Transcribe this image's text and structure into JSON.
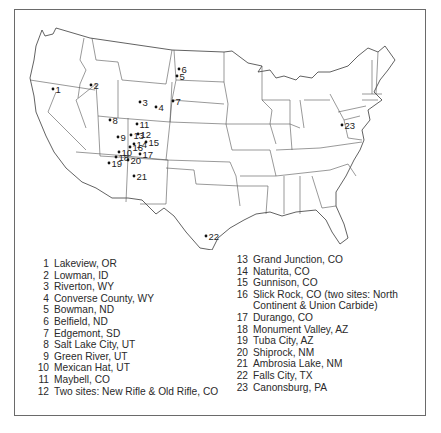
{
  "map": {
    "type": "US map of uranium mill tailings sites",
    "sites": [
      {
        "id": "1",
        "label": "1",
        "x": 53,
        "y": 89
      },
      {
        "id": "2",
        "label": "2",
        "x": 91,
        "y": 85
      },
      {
        "id": "3",
        "label": "3",
        "x": 140,
        "y": 102
      },
      {
        "id": "4",
        "label": "4",
        "x": 156,
        "y": 107
      },
      {
        "id": "5",
        "label": "5",
        "x": 177,
        "y": 76
      },
      {
        "id": "6",
        "label": "6",
        "x": 179,
        "y": 69
      },
      {
        "id": "7",
        "label": "7",
        "x": 173,
        "y": 101
      },
      {
        "id": "8",
        "label": "8",
        "x": 110,
        "y": 120
      },
      {
        "id": "9",
        "label": "9",
        "x": 118,
        "y": 137
      },
      {
        "id": "10",
        "label": "10",
        "x": 119,
        "y": 152
      },
      {
        "id": "11",
        "label": "11",
        "x": 137,
        "y": 124
      },
      {
        "id": "12",
        "label": "12",
        "x": 138,
        "y": 134
      },
      {
        "id": "13",
        "label": "13",
        "x": 131,
        "y": 135
      },
      {
        "id": "14",
        "label": "14",
        "x": 134,
        "y": 144
      },
      {
        "id": "15",
        "label": "15",
        "x": 146,
        "y": 142
      },
      {
        "id": "16",
        "label": "16",
        "x": 130,
        "y": 147
      },
      {
        "id": "17",
        "label": "17",
        "x": 140,
        "y": 154
      },
      {
        "id": "18",
        "label": "18",
        "x": 116,
        "y": 157
      },
      {
        "id": "19",
        "label": "19",
        "x": 109,
        "y": 163
      },
      {
        "id": "20",
        "label": "20",
        "x": 128,
        "y": 160
      },
      {
        "id": "21",
        "label": "21",
        "x": 134,
        "y": 176
      },
      {
        "id": "22",
        "label": "22",
        "x": 206,
        "y": 236
      },
      {
        "id": "23",
        "label": "23",
        "x": 342,
        "y": 125
      }
    ]
  },
  "legend": {
    "left": [
      {
        "num": "1",
        "name": "Lakeview, OR"
      },
      {
        "num": "2",
        "name": "Lowman, ID"
      },
      {
        "num": "3",
        "name": "Riverton, WY"
      },
      {
        "num": "4",
        "name": "Converse County, WY"
      },
      {
        "num": "5",
        "name": "Bowman, ND"
      },
      {
        "num": "6",
        "name": "Belfield, ND"
      },
      {
        "num": "7",
        "name": "Edgemont, SD"
      },
      {
        "num": "8",
        "name": "Salt Lake City, UT"
      },
      {
        "num": "9",
        "name": "Green River, UT"
      },
      {
        "num": "10",
        "name": "Mexican Hat, UT"
      },
      {
        "num": "11",
        "name": "Maybell, CO"
      },
      {
        "num": "12",
        "name": "Two sites: New Rifle & Old Rifle, CO"
      }
    ],
    "right": [
      {
        "num": "13",
        "name": "Grand Junction, CO"
      },
      {
        "num": "14",
        "name": "Naturita, CO"
      },
      {
        "num": "15",
        "name": "Gunnison, CO"
      },
      {
        "num": "16",
        "name": "Slick Rock, CO (two sites: North",
        "cont": "Continent & Union Carbide)"
      },
      {
        "num": "17",
        "name": "Durango, CO"
      },
      {
        "num": "18",
        "name": "Monument Valley, AZ"
      },
      {
        "num": "19",
        "name": "Tuba City, AZ"
      },
      {
        "num": "20",
        "name": "Shiprock, NM"
      },
      {
        "num": "21",
        "name": "Ambrosia Lake, NM"
      },
      {
        "num": "22",
        "name": "Falls City, TX"
      },
      {
        "num": "23",
        "name": "Canonsburg, PA"
      }
    ]
  }
}
